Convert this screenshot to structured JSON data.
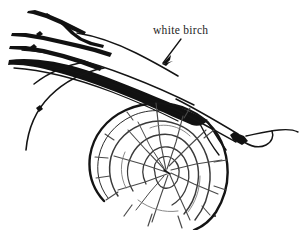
{
  "figure": {
    "type": "line-drawing",
    "background_color": "#ffffff",
    "ink_color": "#141414",
    "width": 302,
    "height": 230
  },
  "annotation": {
    "label": "white birch",
    "label_x": 153,
    "label_y": 25,
    "leader": {
      "name": "arrow",
      "from_x": 181,
      "from_y": 39,
      "to_x": 162,
      "to_y": 63
    }
  },
  "elements": {
    "branch_cluster_name": "birch-branch-cluster",
    "log_name": "log-cross-section",
    "rings_count": 4,
    "radial_cracks_count": 26
  }
}
